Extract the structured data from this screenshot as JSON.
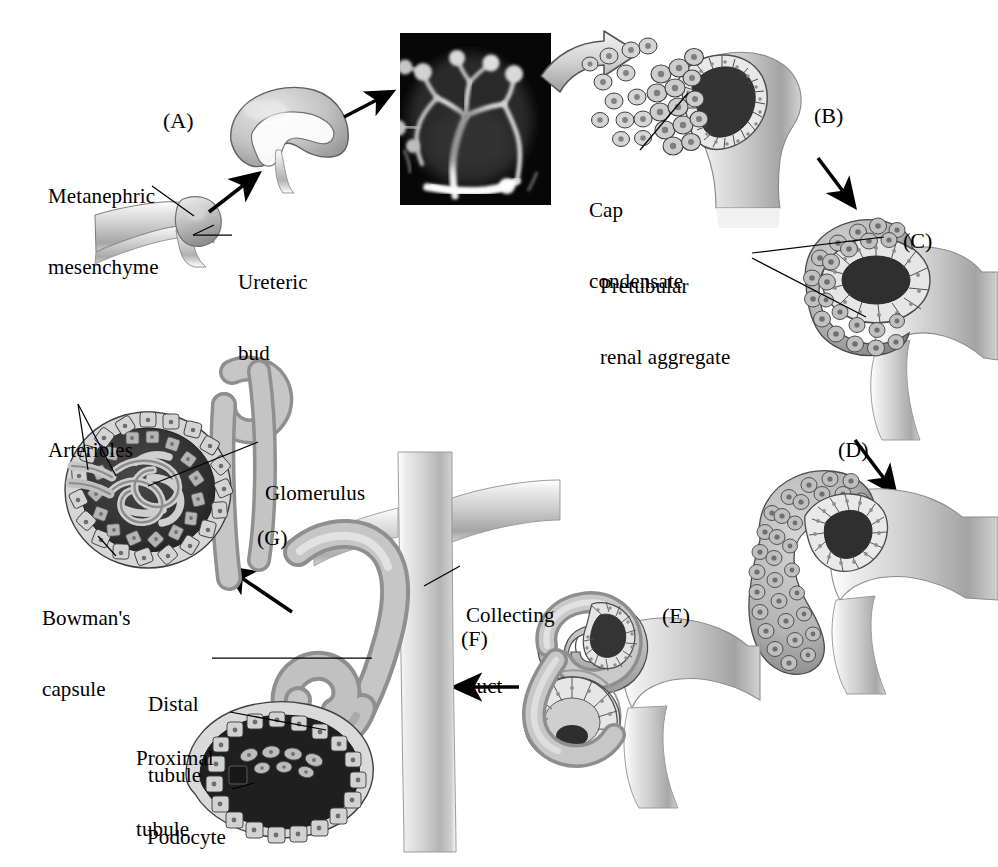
{
  "figure": {
    "background_color": "#ffffff",
    "ink_color": "#000000",
    "tissue_light": "#d8d8d8",
    "tissue_mid": "#a8a8a8",
    "tissue_dark": "#6e6e6e",
    "lumen_dark": "#2a2a2a",
    "micrograph_background": "#070707",
    "micrograph_signal": "#e8e8e8"
  },
  "stage_labels": [
    {
      "id": "A",
      "text": "(A)",
      "x": 163,
      "y": 108
    },
    {
      "id": "B",
      "text": "(B)",
      "x": 814,
      "y": 103
    },
    {
      "id": "C",
      "text": "(C)",
      "x": 903,
      "y": 228
    },
    {
      "id": "D",
      "text": "(D)",
      "x": 838,
      "y": 437
    },
    {
      "id": "E",
      "text": "(E)",
      "x": 662,
      "y": 603
    },
    {
      "id": "F",
      "text": "(F)",
      "x": 461,
      "y": 626
    },
    {
      "id": "G",
      "text": "(G)",
      "x": 257,
      "y": 525
    }
  ],
  "annotations": [
    {
      "name": "metanephric-mesenchyme",
      "lines": [
        "Metanephric",
        "mesenchyme"
      ],
      "x": 48,
      "y": 138,
      "align": "left"
    },
    {
      "name": "ureteric-bud",
      "lines": [
        "Ureteric",
        "bud"
      ],
      "x": 238,
      "y": 224,
      "align": "left"
    },
    {
      "name": "cap-condensate",
      "lines": [
        "Cap",
        "condensate"
      ],
      "x": 589,
      "y": 152,
      "align": "left"
    },
    {
      "name": "pretubular-renal-aggregate",
      "lines": [
        "Pretubular",
        "renal aggregate"
      ],
      "x": 600,
      "y": 228,
      "align": "left"
    },
    {
      "name": "arterioles",
      "lines": [
        "Arterioles"
      ],
      "x": 48,
      "y": 392,
      "align": "left"
    },
    {
      "name": "glomerulus",
      "lines": [
        "Glomerulus"
      ],
      "x": 265,
      "y": 435,
      "align": "left"
    },
    {
      "name": "bowmans-capsule",
      "lines": [
        "Bowman's",
        "capsule"
      ],
      "x": 42,
      "y": 560,
      "align": "left"
    },
    {
      "name": "collecting-duct",
      "lines": [
        "Collecting",
        "duct"
      ],
      "x": 466,
      "y": 557,
      "align": "left"
    },
    {
      "name": "distal-tubule",
      "lines": [
        "Distal",
        "tubule"
      ],
      "x": 148,
      "y": 646,
      "align": "left"
    },
    {
      "name": "proximal-tubule",
      "lines": [
        "Proximal",
        "tubule"
      ],
      "x": 136,
      "y": 700,
      "align": "left"
    },
    {
      "name": "podocyte",
      "lines": [
        "Podocyte"
      ],
      "x": 147,
      "y": 779,
      "align": "left"
    }
  ],
  "panels": [
    {
      "id": "A",
      "name": "ureteric-bud-invasion",
      "description": "Ureteric bud branching into metanephric mesenchyme"
    },
    {
      "id": "micrograph",
      "name": "ureteric-tree-micrograph",
      "description": "Fluorescence micrograph of branched ureteric bud tree",
      "x": 400,
      "y": 33,
      "width": 151,
      "height": 172
    },
    {
      "id": "B",
      "name": "cap-condensate-stage",
      "description": "Cap condensate of mesenchyme around ureteric bud tip"
    },
    {
      "id": "C",
      "name": "pretubular-aggregate-stage",
      "description": "Pretubular renal aggregate and renal vesicle"
    },
    {
      "id": "D",
      "name": "comma-shaped-body-stage",
      "description": "Comma-shaped body"
    },
    {
      "id": "E",
      "name": "s-shaped-body-stage",
      "description": "S-shaped body fusing with collecting duct"
    },
    {
      "id": "F",
      "name": "mature-nephron-stage",
      "description": "Mature nephron with proximal and distal tubules, podocytes, collecting duct"
    },
    {
      "id": "G",
      "name": "glomerulus-detail",
      "description": "Bowman's capsule enclosing glomerular capillary tuft with arterioles"
    }
  ]
}
